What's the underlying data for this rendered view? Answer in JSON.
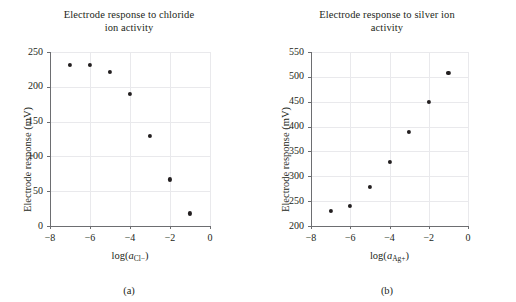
{
  "figure": {
    "panels": [
      {
        "id": "a",
        "caption": "(a)",
        "title_line1": "Electrode response to chloride",
        "title_line2": "ion activity",
        "xlabel_prefix": "log(",
        "xlabel_var": "a",
        "xlabel_sub": "Cl−",
        "xlabel_suffix": ")",
        "ylabel": "Electrode response (mV)",
        "yticks": [
          "0",
          "50",
          "100",
          "150",
          "200",
          "250"
        ],
        "xticks": [
          "−8",
          "−6",
          "−4",
          "−2",
          "0"
        ]
      },
      {
        "id": "b",
        "caption": "(b)",
        "title_line1": "Electrode response to silver ion",
        "title_line2": "activity",
        "xlabel_prefix": "log(",
        "xlabel_var": "a",
        "xlabel_sub": "Ag+",
        "xlabel_suffix": ")",
        "ylabel": "Electrode response (mV)",
        "yticks": [
          "200",
          "250",
          "300",
          "350",
          "400",
          "450",
          "500",
          "550"
        ],
        "xticks": [
          "−8",
          "−6",
          "−4",
          "−2",
          "0"
        ]
      }
    ]
  },
  "chart_data": [
    {
      "type": "scatter",
      "panel": "a",
      "title": "Electrode response to chloride ion activity",
      "xlabel": "log(a_Cl-)",
      "ylabel": "Electrode response (mV)",
      "xlim": [
        -8,
        0
      ],
      "ylim": [
        0,
        250
      ],
      "xticks": [
        -8,
        -6,
        -4,
        -2,
        0
      ],
      "yticks": [
        0,
        50,
        100,
        150,
        200,
        250
      ],
      "grid": true,
      "legend": "none",
      "marker": "filled-circle",
      "marker_color": "#231f20",
      "x": [
        -7,
        -6,
        -5,
        -4,
        -3,
        -2,
        -1
      ],
      "y": [
        232,
        232,
        221,
        190,
        129,
        67,
        18
      ]
    },
    {
      "type": "scatter",
      "panel": "b",
      "title": "Electrode response to silver ion activity",
      "xlabel": "log(a_Ag+)",
      "ylabel": "Electrode response (mV)",
      "xlim": [
        -8,
        0
      ],
      "ylim": [
        200,
        550
      ],
      "xticks": [
        -8,
        -6,
        -4,
        -2,
        0
      ],
      "yticks": [
        200,
        250,
        300,
        350,
        400,
        450,
        500,
        550
      ],
      "grid": true,
      "legend": "none",
      "marker": "filled-circle",
      "marker_color": "#231f20",
      "x": [
        -7,
        -6,
        -5,
        -4,
        -3,
        -2,
        -1
      ],
      "y": [
        231,
        240,
        278,
        329,
        389,
        449,
        508
      ]
    }
  ]
}
